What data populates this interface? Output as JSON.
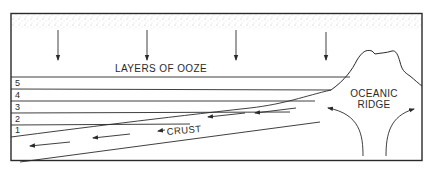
{
  "diagram": {
    "title_label": "LAYERS OF OOZE",
    "ridge_label_line1": "OCEANIC",
    "ridge_label_line2": "RIDGE",
    "crust_label": "CRUST",
    "layer_numbers": [
      "5",
      "4",
      "3",
      "2",
      "1"
    ],
    "colors": {
      "ink": "#2a2a2a",
      "stipple": "#bdbdbd",
      "background": "#ffffff"
    }
  }
}
